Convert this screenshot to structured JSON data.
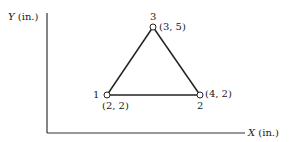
{
  "axes": {
    "y_label_var": "Y",
    "y_label_unit": "(in.)",
    "x_label_var": "X",
    "x_label_unit": "(in.)"
  },
  "nodes": [
    {
      "id": "1",
      "coords": "(2, 2)"
    },
    {
      "id": "2",
      "coords": "(4, 2)"
    },
    {
      "id": "3",
      "coords": "(3, 5)"
    }
  ],
  "colors": {
    "line": "#222222",
    "background": "#ffffff"
  }
}
